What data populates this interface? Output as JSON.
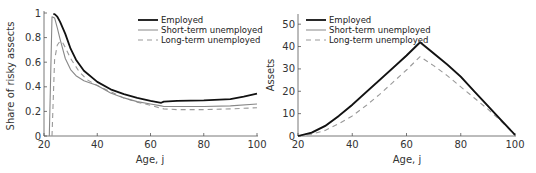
{
  "chart_data": [
    {
      "type": "line",
      "title": "",
      "xlabel": "Age, j",
      "ylabel": "Share of risky assects",
      "xlim": [
        20,
        100
      ],
      "ylim": [
        0,
        1
      ],
      "xticks": [
        "20",
        "40",
        "60",
        "80",
        "100"
      ],
      "yticks": [
        "0",
        "0.2",
        "0.4",
        "0.6",
        "0.8",
        "1"
      ],
      "grid": false,
      "legend_position": "upper right",
      "series": [
        {
          "name": "Employed",
          "style": "solid-thick",
          "color": "#111111",
          "x": [
            23.5,
            24,
            25,
            26,
            28,
            30,
            32,
            35,
            40,
            45,
            50,
            55,
            60,
            64,
            65,
            70,
            80,
            90,
            95,
            100
          ],
          "y": [
            0.99,
            0.99,
            0.97,
            0.93,
            0.83,
            0.71,
            0.62,
            0.53,
            0.44,
            0.38,
            0.34,
            0.31,
            0.285,
            0.27,
            0.28,
            0.285,
            0.29,
            0.3,
            0.32,
            0.345
          ]
        },
        {
          "name": "Short-term unemployed",
          "style": "solid-thin",
          "color": "#888888",
          "x": [
            22,
            23,
            24,
            25,
            26,
            28,
            30,
            32,
            35,
            40,
            45,
            50,
            55,
            60,
            64,
            65,
            70,
            80,
            90,
            100
          ],
          "y": [
            0,
            0.97,
            0.96,
            0.88,
            0.79,
            0.63,
            0.54,
            0.49,
            0.45,
            0.41,
            0.35,
            0.31,
            0.28,
            0.26,
            0.245,
            0.24,
            0.24,
            0.24,
            0.245,
            0.26
          ]
        },
        {
          "name": "Long-term unemployed",
          "style": "dashed",
          "color": "#999999",
          "x": [
            23,
            24,
            25,
            26,
            27,
            28,
            30,
            33,
            36,
            40,
            45,
            50,
            55,
            60,
            64,
            65,
            70,
            80,
            90,
            100
          ],
          "y": [
            0,
            0.62,
            0.74,
            0.77,
            0.76,
            0.72,
            0.63,
            0.53,
            0.46,
            0.41,
            0.36,
            0.31,
            0.275,
            0.25,
            0.225,
            0.22,
            0.215,
            0.215,
            0.22,
            0.23
          ]
        }
      ]
    },
    {
      "type": "line",
      "title": "",
      "xlabel": "Age, j",
      "ylabel": "Assets",
      "xlim": [
        20,
        100
      ],
      "ylim": [
        0,
        55
      ],
      "xticks": [
        "20",
        "40",
        "60",
        "80",
        "100"
      ],
      "yticks": [
        "0",
        "10",
        "20",
        "30",
        "40",
        "50"
      ],
      "grid": false,
      "legend_position": "upper left",
      "series": [
        {
          "name": "Employed",
          "style": "solid-thick",
          "color": "#111111",
          "x": [
            20,
            25,
            30,
            35,
            40,
            45,
            50,
            55,
            60,
            65,
            70,
            75,
            80,
            85,
            90,
            95,
            100
          ],
          "y": [
            0,
            1.5,
            4.5,
            9,
            14,
            19.5,
            25,
            30.5,
            36,
            42,
            37,
            32,
            26.5,
            20,
            13.5,
            7,
            0.5
          ]
        },
        {
          "name": "Short-term unemployed",
          "style": "solid-thin",
          "color": "#888888",
          "x": [
            20,
            25,
            30,
            35,
            40,
            45,
            50,
            55,
            60,
            65,
            70,
            75,
            80,
            85,
            90,
            95,
            100
          ],
          "y": [
            0,
            1.3,
            4.2,
            8.7,
            13.7,
            19.2,
            24.7,
            30.2,
            35.7,
            41.6,
            36.7,
            31.7,
            26.2,
            19.8,
            13.3,
            6.8,
            0.5
          ]
        },
        {
          "name": "Long-term unemployed",
          "style": "dashed",
          "color": "#999999",
          "x": [
            20,
            25,
            30,
            35,
            40,
            45,
            50,
            55,
            60,
            65,
            70,
            75,
            80,
            85,
            90,
            95,
            100
          ],
          "y": [
            0,
            0.8,
            2.5,
            5.5,
            9,
            13.5,
            18.5,
            24,
            29.5,
            35.5,
            31.5,
            27,
            22,
            17,
            12,
            6.5,
            0.5
          ]
        }
      ]
    }
  ],
  "left": {
    "ylabel": "Share of risky assects",
    "xlabel": "Age, j",
    "legend": [
      "Employed",
      "Short-term unemployed",
      "Long-term unemployed"
    ]
  },
  "right": {
    "ylabel": "Assets",
    "xlabel": "Age, j",
    "legend": [
      "Employed",
      "Short-term unemployed",
      "Long-term unemployed"
    ]
  }
}
